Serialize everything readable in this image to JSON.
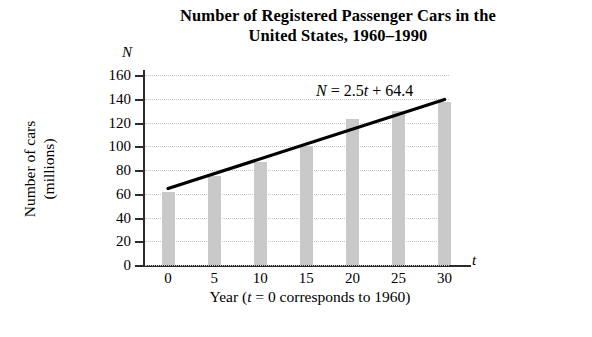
{
  "chart_data": {
    "type": "bar",
    "title": "Number of Registered Passenger Cars in the United States, 1960–1990",
    "title_line1": "Number of Registered Passenger Cars in the",
    "title_line2": "United States, 1960–1990",
    "xlabel": "Year (t = 0 corresponds to 1960)",
    "ylabel": "Number of cars (millions)",
    "ylabel_line1": "Number of cars",
    "ylabel_line2": "(millions)",
    "x_axis_letter": "t",
    "y_axis_letter": "N",
    "categories": [
      0,
      5,
      10,
      15,
      20,
      25,
      30
    ],
    "xtick_labels": [
      "0",
      "5",
      "10",
      "15",
      "20",
      "25",
      "30"
    ],
    "values": [
      61.7,
      75,
      87,
      100,
      123,
      130,
      137
    ],
    "ytick_labels": [
      "160",
      "140",
      "120",
      "100",
      "80",
      "60",
      "40",
      "20",
      "0"
    ],
    "yticks": [
      160,
      140,
      120,
      100,
      80,
      60,
      40,
      20,
      0
    ],
    "ylim": [
      0,
      160
    ],
    "xlim": [
      -2.5,
      32
    ],
    "grid": "horizontal-dotted",
    "legend": "none",
    "bar_color": "#c9c9c9",
    "axis_color": "#2b2b2b",
    "grid_color": "#c4c4c4",
    "trend_line": {
      "label": "N = 2.5t + 64.4",
      "equation_lhs": "N",
      "equation_eq": " = 2.5",
      "equation_var": "t",
      "equation_rhs": " + 64.4",
      "slope": 2.5,
      "intercept": 64.4,
      "x_start": 0,
      "x_end": 30,
      "y_start": 64.4,
      "y_end": 139.4,
      "color": "#000000"
    }
  }
}
